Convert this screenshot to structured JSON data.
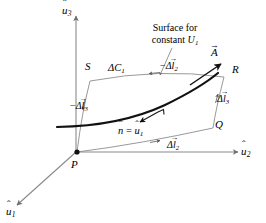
{
  "figure": {
    "type": "vector-calculus-diagram",
    "background_color": "#ffffff",
    "line_color": "#7a7a7a",
    "emphasis_color": "#000000"
  },
  "axes": [
    {
      "id": "u3",
      "label_base": "u",
      "accent": "^",
      "subscript": "3",
      "direction": "up"
    },
    {
      "id": "u2",
      "label_base": "u",
      "accent": "^",
      "subscript": "2",
      "direction": "right"
    },
    {
      "id": "u1",
      "label_base": "u",
      "accent": "^",
      "subscript": "1",
      "direction": "lower-left"
    }
  ],
  "points": [
    {
      "id": "P",
      "label": "P",
      "role": "origin-corner"
    },
    {
      "id": "Q",
      "label": "Q",
      "role": "corner"
    },
    {
      "id": "R",
      "label": "R",
      "role": "corner"
    },
    {
      "id": "S",
      "label": "S",
      "role": "corner"
    }
  ],
  "annotations": {
    "surface_note_line1": "Surface for",
    "surface_note_line2_prefix": "constant ",
    "surface_note_line2_symbol": "U",
    "surface_note_line2_subscript": "1",
    "delta_c1": {
      "base": "ΔC",
      "subscript": "1"
    },
    "normal_equation": {
      "lhs_base": "n",
      "lhs_accent": "^",
      "equals": "=",
      "rhs_base": "u",
      "rhs_accent": "^",
      "rhs_subscript": "1"
    },
    "vector_A": {
      "base": "A",
      "accent": "→"
    },
    "minus_dl2": {
      "sign": "−",
      "delta": "Δ",
      "base": "l",
      "accent": "→",
      "subscript": "2"
    },
    "minus_dl3": {
      "sign": "−",
      "delta": "Δ",
      "base": "l",
      "accent": "→",
      "subscript": "3"
    },
    "plus_dl2": {
      "sign": "",
      "delta": "Δ",
      "base": "l",
      "accent": "→",
      "subscript": "2"
    },
    "plus_dl3": {
      "sign": "",
      "delta": "Δ",
      "base": "l",
      "accent": "→",
      "subscript": "3"
    }
  }
}
